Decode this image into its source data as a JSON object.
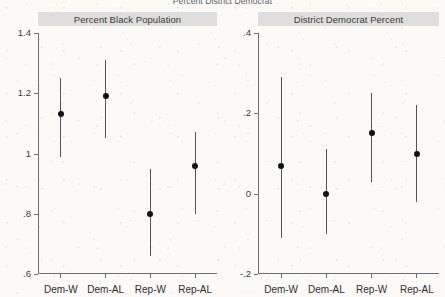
{
  "suptitle": "Percent District Democrat",
  "panels": [
    {
      "title": "Percent Black Population",
      "categories": [
        "Dem-W",
        "Dem-AL",
        "Rep-W",
        "Rep-AL"
      ],
      "yticks": [
        "1.4",
        "1.2",
        "1",
        ".8",
        ".6"
      ]
    },
    {
      "title": "District Democrat Percent",
      "categories": [
        "Dem-W",
        "Dem-AL",
        "Rep-W",
        "Rep-AL"
      ],
      "yticks": [
        ".4",
        ".2",
        "0",
        "-.2"
      ]
    }
  ],
  "chart_data": [
    {
      "type": "scatter",
      "title": "Percent Black Population",
      "suptitle": "Percent District Democrat",
      "xlabel": "",
      "ylabel": "",
      "ylim": [
        0.6,
        1.4
      ],
      "ytick_values": [
        1.4,
        1.2,
        1.0,
        0.8,
        0.6
      ],
      "ytick_labels": [
        "1.4",
        "1.2",
        "1",
        ".8",
        ".6"
      ],
      "grid": false,
      "legend": "none",
      "categories": [
        "Dem-W",
        "Dem-AL",
        "Rep-W",
        "Rep-AL"
      ],
      "values": [
        1.13,
        1.19,
        0.8,
        0.96
      ],
      "ci_lower": [
        0.99,
        1.05,
        0.66,
        0.8
      ],
      "ci_upper": [
        1.25,
        1.31,
        0.95,
        1.07
      ]
    },
    {
      "type": "scatter",
      "title": "District Democrat Percent",
      "suptitle": "Percent District Democrat",
      "xlabel": "",
      "ylabel": "",
      "ylim": [
        -0.2,
        0.4
      ],
      "ytick_values": [
        0.4,
        0.2,
        0.0,
        -0.2
      ],
      "ytick_labels": [
        ".4",
        ".2",
        "0",
        "-.2"
      ],
      "grid": false,
      "legend": "none",
      "categories": [
        "Dem-W",
        "Dem-AL",
        "Rep-W",
        "Rep-AL"
      ],
      "values": [
        0.07,
        0.0,
        0.15,
        0.1
      ],
      "ci_lower": [
        -0.11,
        -0.1,
        0.03,
        -0.02
      ],
      "ci_upper": [
        0.29,
        0.11,
        0.25,
        0.22
      ]
    }
  ],
  "colors": {
    "point": "#111111",
    "whisker": "#555555",
    "axis": "#6f6f6f",
    "title_bar": "#dededd",
    "background": "#fbfaf7"
  }
}
